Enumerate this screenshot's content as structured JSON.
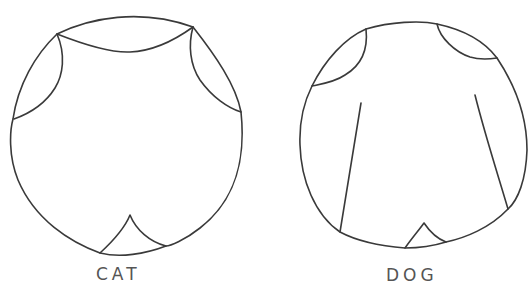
{
  "figures": [
    {
      "id": "cat",
      "label": "CAT",
      "description": "Hand-drawn circle representing a cat's chest/body outline with two upper side arcs, a top scalloped arc and a small pointed notch at the bottom"
    },
    {
      "id": "dog",
      "label": "DOG",
      "description": "Hand-drawn circle representing a dog's chest/body outline with two upper corner arcs, two slanted vertical lines and a small pointed notch at the bottom"
    }
  ],
  "colors": {
    "background": "#ffffff",
    "stroke": "#3a3a3a",
    "label": "#555555"
  }
}
